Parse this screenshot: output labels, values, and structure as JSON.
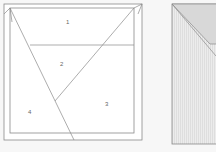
{
  "diagram": {
    "left_panel": {
      "regions": [
        {
          "id": "1",
          "label": "1"
        },
        {
          "id": "2",
          "label": "2"
        },
        {
          "id": "3",
          "label": "3"
        },
        {
          "id": "4",
          "label": "4"
        }
      ]
    },
    "right_panel": {
      "description": "shaded folded square, partially visible"
    },
    "colors": {
      "background": "#f7f7f7",
      "line": "#8a8a8a",
      "paper": "#ffffff",
      "shade_light": "#dcdcdc",
      "shade_stripe": "#e6e6e6"
    }
  }
}
